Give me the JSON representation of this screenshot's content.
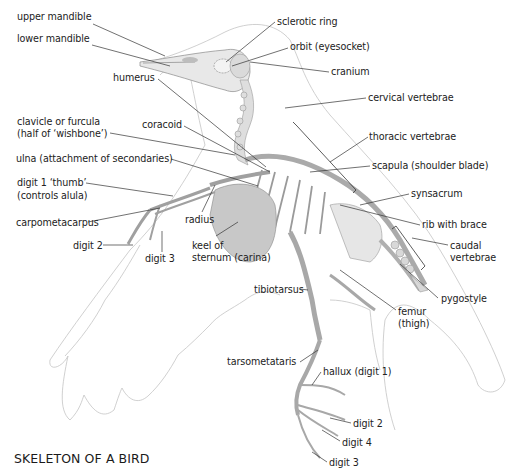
{
  "diagram": {
    "title": "SKELETON OF A BIRD",
    "colors": {
      "text": "#222222",
      "leader": "#333333",
      "outline": "#bdbdbd",
      "bone": "#e4e4e4",
      "bone_shade": "#a8a8a8"
    },
    "labels": [
      {
        "id": "upper-mandible",
        "text": "upper mandible",
        "x": 17,
        "y": 18
      },
      {
        "id": "lower-mandible",
        "text": "lower mandible",
        "x": 17,
        "y": 40
      },
      {
        "id": "sclerotic-ring",
        "text": "sclerotic ring",
        "x": 277,
        "y": 18
      },
      {
        "id": "orbit",
        "text": "orbit (eyesocket)",
        "x": 290,
        "y": 43
      },
      {
        "id": "cranium",
        "text": "cranium",
        "x": 331,
        "y": 67
      },
      {
        "id": "cervical-vertebrae",
        "text": "cervical vertebrae",
        "x": 368,
        "y": 93
      },
      {
        "id": "humerus",
        "text": "humerus",
        "x": 113,
        "y": 73
      },
      {
        "id": "clavicle",
        "text": "clavicle or furcula",
        "x": 17,
        "y": 117
      },
      {
        "id": "clavicle-2",
        "text": "(half of ‘wishbone’)",
        "x": 17,
        "y": 129
      },
      {
        "id": "coracoid",
        "text": "coracoid",
        "x": 142,
        "y": 120
      },
      {
        "id": "thoracic-vertebrae",
        "text": "thoracic vertebrae",
        "x": 369,
        "y": 132
      },
      {
        "id": "ulna",
        "text": "ulna (attachment of secondaries)",
        "x": 16,
        "y": 154
      },
      {
        "id": "scapula",
        "text": "scapula (shoulder blade)",
        "x": 372,
        "y": 161
      },
      {
        "id": "digit-1",
        "text": "digit 1 ‘thumb’",
        "x": 17,
        "y": 178
      },
      {
        "id": "digit-1b",
        "text": "(controls alula)",
        "x": 17,
        "y": 191
      },
      {
        "id": "synsacrum",
        "text": "synsacrum",
        "x": 411,
        "y": 189
      },
      {
        "id": "carpometacarpus",
        "text": "carpometacarpus",
        "x": 16,
        "y": 218
      },
      {
        "id": "radius",
        "text": "radius",
        "x": 185,
        "y": 215
      },
      {
        "id": "rib-with-brace",
        "text": "rib with brace",
        "x": 422,
        "y": 220
      },
      {
        "id": "digit-2-wing",
        "text": "digit 2",
        "x": 73,
        "y": 241
      },
      {
        "id": "keel",
        "text": "keel of",
        "x": 192,
        "y": 241
      },
      {
        "id": "keel-2",
        "text": "sternum (carina)",
        "x": 192,
        "y": 253
      },
      {
        "id": "digit-3-wing",
        "text": "digit 3",
        "x": 145,
        "y": 254
      },
      {
        "id": "caudal",
        "text": "caudal",
        "x": 450,
        "y": 241
      },
      {
        "id": "caudal-2",
        "text": "vertebrae",
        "x": 450,
        "y": 253
      },
      {
        "id": "tibiotarsus",
        "text": "tibiotarsus",
        "x": 254,
        "y": 285
      },
      {
        "id": "pygostyle",
        "text": "pygostyle",
        "x": 441,
        "y": 294
      },
      {
        "id": "femur",
        "text": "femur",
        "x": 398,
        "y": 307
      },
      {
        "id": "femur-2",
        "text": "(thigh)",
        "x": 398,
        "y": 319
      },
      {
        "id": "tarsometataris",
        "text": "tarsometataris",
        "x": 227,
        "y": 357
      },
      {
        "id": "hallux",
        "text": "hallux (digit 1)",
        "x": 323,
        "y": 367
      },
      {
        "id": "digit-2-foot",
        "text": "digit 2",
        "x": 353,
        "y": 419
      },
      {
        "id": "digit-4-foot",
        "text": "digit 4",
        "x": 342,
        "y": 438
      },
      {
        "id": "digit-3-foot",
        "text": "digit 3",
        "x": 329,
        "y": 458
      }
    ]
  }
}
